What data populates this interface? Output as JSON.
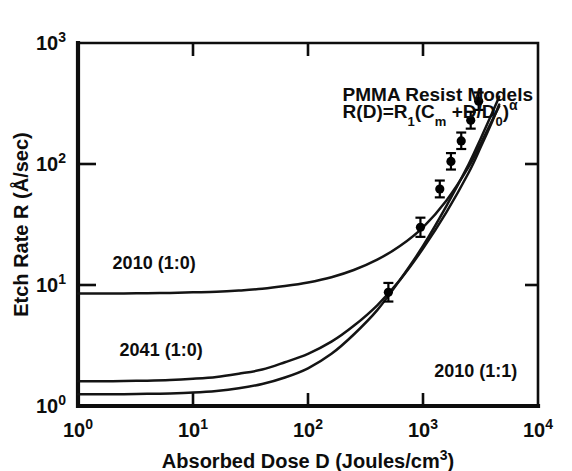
{
  "chart_data": {
    "type": "line",
    "title": "",
    "xlabel": "Absorbed Dose D (Joules/cm",
    "xlabel_exp": "3",
    "xlabel_tail": ")",
    "ylabel": "Etch Rate R (Å/sec)",
    "xscale": "log",
    "yscale": "log",
    "xlim": [
      1,
      10000
    ],
    "ylim": [
      1,
      1000
    ],
    "grid": false,
    "legend_position": "inline-curve-labels",
    "xticks": [
      {
        "value": 1,
        "label": "10",
        "exp": "0"
      },
      {
        "value": 10,
        "label": "10",
        "exp": "1"
      },
      {
        "value": 100,
        "label": "10",
        "exp": "2"
      },
      {
        "value": 1000,
        "label": "10",
        "exp": "3"
      },
      {
        "value": 10000,
        "label": "10",
        "exp": "4"
      }
    ],
    "yticks": [
      {
        "value": 1,
        "label": "10",
        "exp": "0"
      },
      {
        "value": 10,
        "label": "10",
        "exp": "1"
      },
      {
        "value": 100,
        "label": "10",
        "exp": "2"
      },
      {
        "value": 1000,
        "label": "10",
        "exp": "3"
      }
    ],
    "annotations": [
      {
        "name": "model-title",
        "text": "PMMA Resist Models",
        "x": 200,
        "y": 330
      },
      {
        "name": "model-equation",
        "text": "R(D)=R₁(Cₘ+D/D₀)ᵅ",
        "x": 200,
        "y": 240
      }
    ],
    "series": [
      {
        "name": "2010 (1:0)",
        "label": "2010 (1:0)",
        "label_x": 2.0,
        "label_y": 13.5,
        "plateau": 8.5,
        "D0": 1400,
        "alpha": 1.55,
        "Cm": 1.0,
        "points": [
          [
            1.0,
            8.5
          ],
          [
            1.6,
            8.5
          ],
          [
            2.5,
            8.52
          ],
          [
            4.0,
            8.55
          ],
          [
            6.3,
            8.6
          ],
          [
            10,
            8.7
          ],
          [
            16,
            8.8
          ],
          [
            25,
            9.0
          ],
          [
            40,
            9.3
          ],
          [
            63,
            9.8
          ],
          [
            100,
            10.5
          ],
          [
            160,
            11.6
          ],
          [
            250,
            13.3
          ],
          [
            400,
            16.2
          ],
          [
            630,
            21
          ],
          [
            1000,
            30
          ],
          [
            1600,
            50
          ],
          [
            2500,
            95
          ],
          [
            3200,
            150
          ],
          [
            4000,
            230
          ],
          [
            4600,
            300
          ]
        ]
      },
      {
        "name": "2041 (1:0)",
        "label": "2041 (1:0)",
        "label_x": 2.3,
        "label_y": 2.6,
        "plateau": 1.6,
        "D0": 420,
        "alpha": 1.6,
        "Cm": 1.0,
        "points": [
          [
            1.0,
            1.6
          ],
          [
            1.6,
            1.6
          ],
          [
            2.5,
            1.61
          ],
          [
            4.0,
            1.62
          ],
          [
            6.3,
            1.64
          ],
          [
            10,
            1.68
          ],
          [
            16,
            1.74
          ],
          [
            25,
            1.85
          ],
          [
            40,
            2.0
          ],
          [
            63,
            2.3
          ],
          [
            100,
            2.7
          ],
          [
            160,
            3.4
          ],
          [
            250,
            4.6
          ],
          [
            400,
            6.8
          ],
          [
            630,
            11
          ],
          [
            1000,
            20
          ],
          [
            1600,
            40
          ],
          [
            2500,
            85
          ],
          [
            3200,
            140
          ],
          [
            4000,
            225
          ],
          [
            4600,
            310
          ]
        ]
      },
      {
        "name": "2010 (1:1)",
        "label": "2010 (1:1)",
        "label_x": 1250,
        "label_y": 1.75,
        "plateau": 1.25,
        "D0": 230,
        "alpha": 1.75,
        "Cm": 1.0,
        "points": [
          [
            1.0,
            1.25
          ],
          [
            1.6,
            1.25
          ],
          [
            2.5,
            1.25
          ],
          [
            4.0,
            1.26
          ],
          [
            6.3,
            1.27
          ],
          [
            10,
            1.29
          ],
          [
            16,
            1.33
          ],
          [
            25,
            1.4
          ],
          [
            40,
            1.52
          ],
          [
            63,
            1.72
          ],
          [
            100,
            2.05
          ],
          [
            160,
            2.7
          ],
          [
            250,
            3.9
          ],
          [
            400,
            6.2
          ],
          [
            630,
            11
          ],
          [
            1000,
            21
          ],
          [
            1600,
            45
          ],
          [
            2500,
            100
          ],
          [
            3200,
            165
          ],
          [
            4000,
            265
          ],
          [
            4600,
            360
          ]
        ]
      }
    ],
    "data_points": {
      "name": "measured-etch-rates",
      "marker": "filled-circle-with-error-bars",
      "values": [
        {
          "x": 500,
          "y": 8.7,
          "yerr_low": 7.3,
          "yerr_high": 10.4
        },
        {
          "x": 950,
          "y": 30,
          "yerr_low": 25,
          "yerr_high": 36
        },
        {
          "x": 1400,
          "y": 62,
          "yerr_low": 53,
          "yerr_high": 73
        },
        {
          "x": 1750,
          "y": 105,
          "yerr_low": 90,
          "yerr_high": 123
        },
        {
          "x": 2150,
          "y": 155,
          "yerr_low": 133,
          "yerr_high": 182
        },
        {
          "x": 2600,
          "y": 230,
          "yerr_low": 196,
          "yerr_high": 270
        },
        {
          "x": 3050,
          "y": 330,
          "yerr_low": 280,
          "yerr_high": 390
        }
      ]
    }
  },
  "colors": {
    "ink": "#0d0d0d",
    "background": "#ffffff",
    "curve": "#141414",
    "marker": "#000000"
  }
}
